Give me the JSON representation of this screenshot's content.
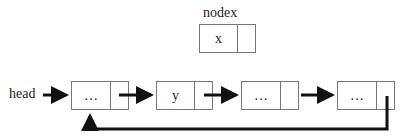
{
  "diagram": {
    "type": "circular-linked-list",
    "nodex": {
      "label": "nodex",
      "value": "x"
    },
    "head_label": "head",
    "nodes": [
      {
        "value": "…"
      },
      {
        "value": "y"
      },
      {
        "value": "…"
      },
      {
        "value": "…"
      }
    ],
    "edges": [
      {
        "from": "head",
        "to": "node-0"
      },
      {
        "from": "node-0",
        "to": "node-1"
      },
      {
        "from": "node-1",
        "to": "node-2"
      },
      {
        "from": "node-2",
        "to": "node-3"
      },
      {
        "from": "node-3",
        "to": "node-0",
        "style": "return-loop"
      }
    ],
    "colors": {
      "stroke": "#777777",
      "arrow": "#111111",
      "text": "#222222"
    }
  }
}
